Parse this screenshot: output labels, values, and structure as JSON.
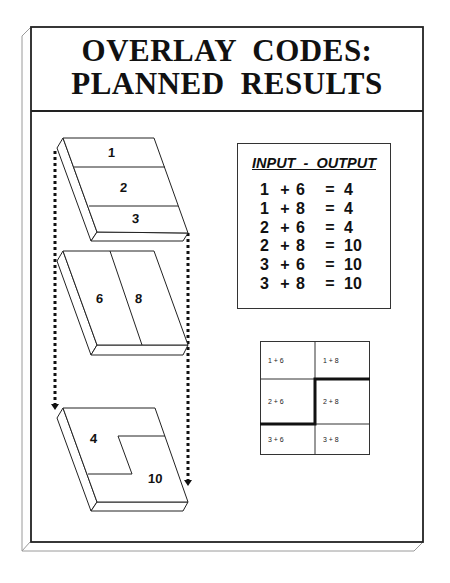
{
  "title": {
    "line1": "OVERLAY  CODES:",
    "line2": "PLANNED  RESULTS"
  },
  "layers": {
    "layer1": {
      "zones": [
        "1",
        "2",
        "3"
      ]
    },
    "layer2": {
      "zones": [
        "6",
        "8"
      ]
    },
    "result": {
      "zones": [
        "4",
        "10"
      ]
    }
  },
  "io_table": {
    "header": "INPUT  -  OUTPUT",
    "rows": [
      {
        "a": "1",
        "op": "+",
        "b": "6",
        "eq": "=",
        "r": "4"
      },
      {
        "a": "1",
        "op": "+",
        "b": "8",
        "eq": "=",
        "r": "4"
      },
      {
        "a": "2",
        "op": "+",
        "b": "6",
        "eq": "=",
        "r": "4"
      },
      {
        "a": "2",
        "op": "+",
        "b": "8",
        "eq": "=",
        "r": "10"
      },
      {
        "a": "3",
        "op": "+",
        "b": "6",
        "eq": "=",
        "r": "10"
      },
      {
        "a": "3",
        "op": "+",
        "b": "8",
        "eq": "=",
        "r": "10"
      }
    ]
  },
  "combination_grid": {
    "cells": [
      [
        "1 + 6",
        "1 + 8"
      ],
      [
        "2 + 6",
        "2 + 8"
      ],
      [
        "3 + 6",
        "3 + 8"
      ]
    ]
  }
}
